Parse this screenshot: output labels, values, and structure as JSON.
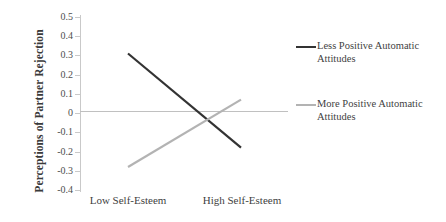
{
  "chart_data": {
    "type": "line",
    "title": "",
    "xlabel": "",
    "ylabel": "Perceptions of Partner Rejection",
    "categories": [
      "Low Self-Esteem",
      "High Self-Esteem"
    ],
    "x": [
      0,
      1
    ],
    "ylim": [
      -0.4,
      0.5
    ],
    "ytick_labels": [
      "0.5",
      "0.4",
      "0.3",
      "0.2",
      "0.1",
      "0",
      "-0.1",
      "-0.2",
      "-0.3",
      "-0.4"
    ],
    "ytick_values": [
      0.5,
      0.4,
      0.3,
      0.2,
      0.1,
      0,
      -0.1,
      -0.2,
      -0.3,
      -0.4
    ],
    "grid": false,
    "legend_position": "right",
    "zero_line": true,
    "series": [
      {
        "name": "Less Positive Automatic Attitudes",
        "values": [
          0.31,
          -0.18
        ],
        "color": "#333333"
      },
      {
        "name": "More Positive Automatic Attitudes",
        "values": [
          -0.28,
          0.07
        ],
        "color": "#b3b3b3"
      }
    ]
  },
  "axes": {
    "y_title": "Perceptions of Partner Rejection",
    "y_ticks": [
      {
        "label": "0.5",
        "value": 0.5
      },
      {
        "label": "0.4",
        "value": 0.4
      },
      {
        "label": "0.3",
        "value": 0.3
      },
      {
        "label": "0.2",
        "value": 0.2
      },
      {
        "label": "0.1",
        "value": 0.1
      },
      {
        "label": "0",
        "value": 0
      },
      {
        "label": "-0.1",
        "value": -0.1
      },
      {
        "label": "-0.2",
        "value": -0.2
      },
      {
        "label": "-0.3",
        "value": -0.3
      },
      {
        "label": "-0.4",
        "value": -0.4
      }
    ],
    "x_labels": [
      {
        "label": "Low Self-Esteem"
      },
      {
        "label": "High Self-Esteem"
      }
    ]
  },
  "legend": {
    "entries": [
      {
        "label": "Less Positive Automatic Attitudes",
        "color": "#333333"
      },
      {
        "label": "More Positive Automatic Attitudes",
        "color": "#b3b3b3"
      }
    ]
  },
  "colors": {
    "series_dark": "#333333",
    "series_light": "#b3b3b3",
    "axis": "#c9c9c9",
    "zero_line": "#c0c0c0",
    "text": "#3f3f3f",
    "background": "#ffffff"
  }
}
